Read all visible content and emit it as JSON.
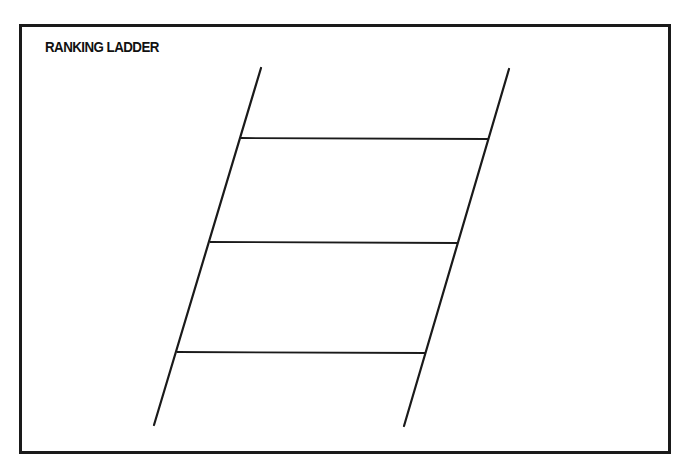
{
  "worksheet": {
    "title": "RANKING LADDER",
    "colors": {
      "ink": "#1a1a1a",
      "background": "#ffffff"
    }
  },
  "ladder": {
    "left_rail": {
      "x1": 261,
      "y1": 68,
      "x2": 154,
      "y2": 425
    },
    "right_rail": {
      "x1": 509,
      "y1": 69,
      "x2": 404,
      "y2": 426
    },
    "rungs": [
      {
        "index": 1,
        "x1": 241,
        "y1": 138,
        "x2": 488,
        "y2": 139
      },
      {
        "index": 2,
        "x1": 210,
        "y1": 242,
        "x2": 458,
        "y2": 243
      },
      {
        "index": 3,
        "x1": 177,
        "y1": 352,
        "x2": 426,
        "y2": 353
      }
    ],
    "slots": [
      {
        "position": "top",
        "label": ""
      },
      {
        "position": "upper-middle",
        "label": ""
      },
      {
        "position": "lower-middle",
        "label": ""
      },
      {
        "position": "bottom",
        "label": ""
      }
    ]
  }
}
